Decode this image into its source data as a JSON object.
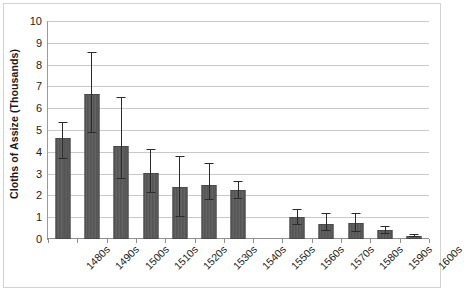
{
  "chart_data": {
    "type": "bar",
    "title": "",
    "xlabel": "",
    "ylabel": "Cloths of Assize (Thousands)",
    "ylim": [
      0,
      10
    ],
    "ytick_step": 1,
    "grid": true,
    "legend": "none",
    "error_bars": true,
    "categories": [
      "1480s",
      "1490s",
      "1500s",
      "1510s",
      "1520s",
      "1530s",
      "1540s",
      "1550s",
      "1560s",
      "1570s",
      "1580s",
      "1590s",
      "1600s"
    ],
    "values": [
      4.65,
      6.65,
      4.25,
      3.05,
      2.4,
      2.5,
      2.25,
      null,
      1.0,
      0.7,
      0.72,
      0.4,
      0.15
    ],
    "error_low": [
      3.65,
      4.85,
      2.75,
      2.1,
      1.0,
      1.8,
      1.85,
      null,
      0.65,
      0.35,
      0.3,
      0.25,
      0.1
    ],
    "error_high": [
      5.35,
      8.6,
      6.5,
      4.15,
      3.8,
      3.5,
      2.65,
      null,
      1.4,
      1.2,
      1.2,
      0.6,
      0.22
    ],
    "ytick_labels": [
      "0",
      "1",
      "2",
      "3",
      "4",
      "5",
      "6",
      "7",
      "8",
      "9",
      "10"
    ]
  },
  "colors": {
    "bar_fill": "#5c5c5c",
    "bar_border": "#4a4a4a",
    "error_bar": "#2b2b2b",
    "gridline": "#c9c9c9",
    "axis": "#8f8f8f",
    "panel_border": "#d2d2d2",
    "background": "#ffffff",
    "text": "#1b1b1b"
  }
}
